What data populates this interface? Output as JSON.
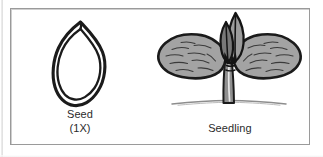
{
  "figure": {
    "background_color": "#ffffff",
    "frame_color": "#9a9a9a",
    "ink_color": "#1a1a1a",
    "fill_gray": "#a3a3a3",
    "panels": [
      {
        "id": "seed",
        "illustration": "seed-outline-illustration",
        "caption_name": "Seed",
        "caption_scale": "(1X)"
      },
      {
        "id": "seedling",
        "illustration": "seedling-illustration",
        "caption_name": "Seedling",
        "caption_scale": ""
      }
    ]
  }
}
